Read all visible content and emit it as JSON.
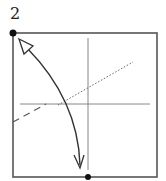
{
  "diagram": {
    "step_number": "2",
    "type": "origami-fold-step",
    "paper": {
      "x": 13,
      "y": 33,
      "size": 144
    },
    "colors": {
      "stroke": "#555555",
      "dot": "#111111",
      "arrow": "#333333"
    },
    "points": [
      {
        "name": "top-left-corner",
        "x": 13,
        "y": 33
      },
      {
        "name": "bottom-center",
        "x": 88,
        "y": 177
      }
    ],
    "lines": [
      {
        "name": "vertical-crease",
        "style": "solid",
        "x1": 88,
        "y1": 38,
        "x2": 88,
        "y2": 170
      },
      {
        "name": "horizontal-crease",
        "style": "solid",
        "x1": 20,
        "y1": 104,
        "x2": 150,
        "y2": 104
      },
      {
        "name": "mountain-fold-line",
        "style": "dotted",
        "x1": 60,
        "y1": 104,
        "x2": 133,
        "y2": 62
      },
      {
        "name": "valley-fold-line",
        "style": "dashed",
        "x1": 13,
        "y1": 122,
        "x2": 45,
        "y2": 104
      }
    ],
    "arrow": {
      "name": "fold-arrow",
      "from": "bottom-center",
      "to": "top-left-corner",
      "double_headed": true
    }
  }
}
